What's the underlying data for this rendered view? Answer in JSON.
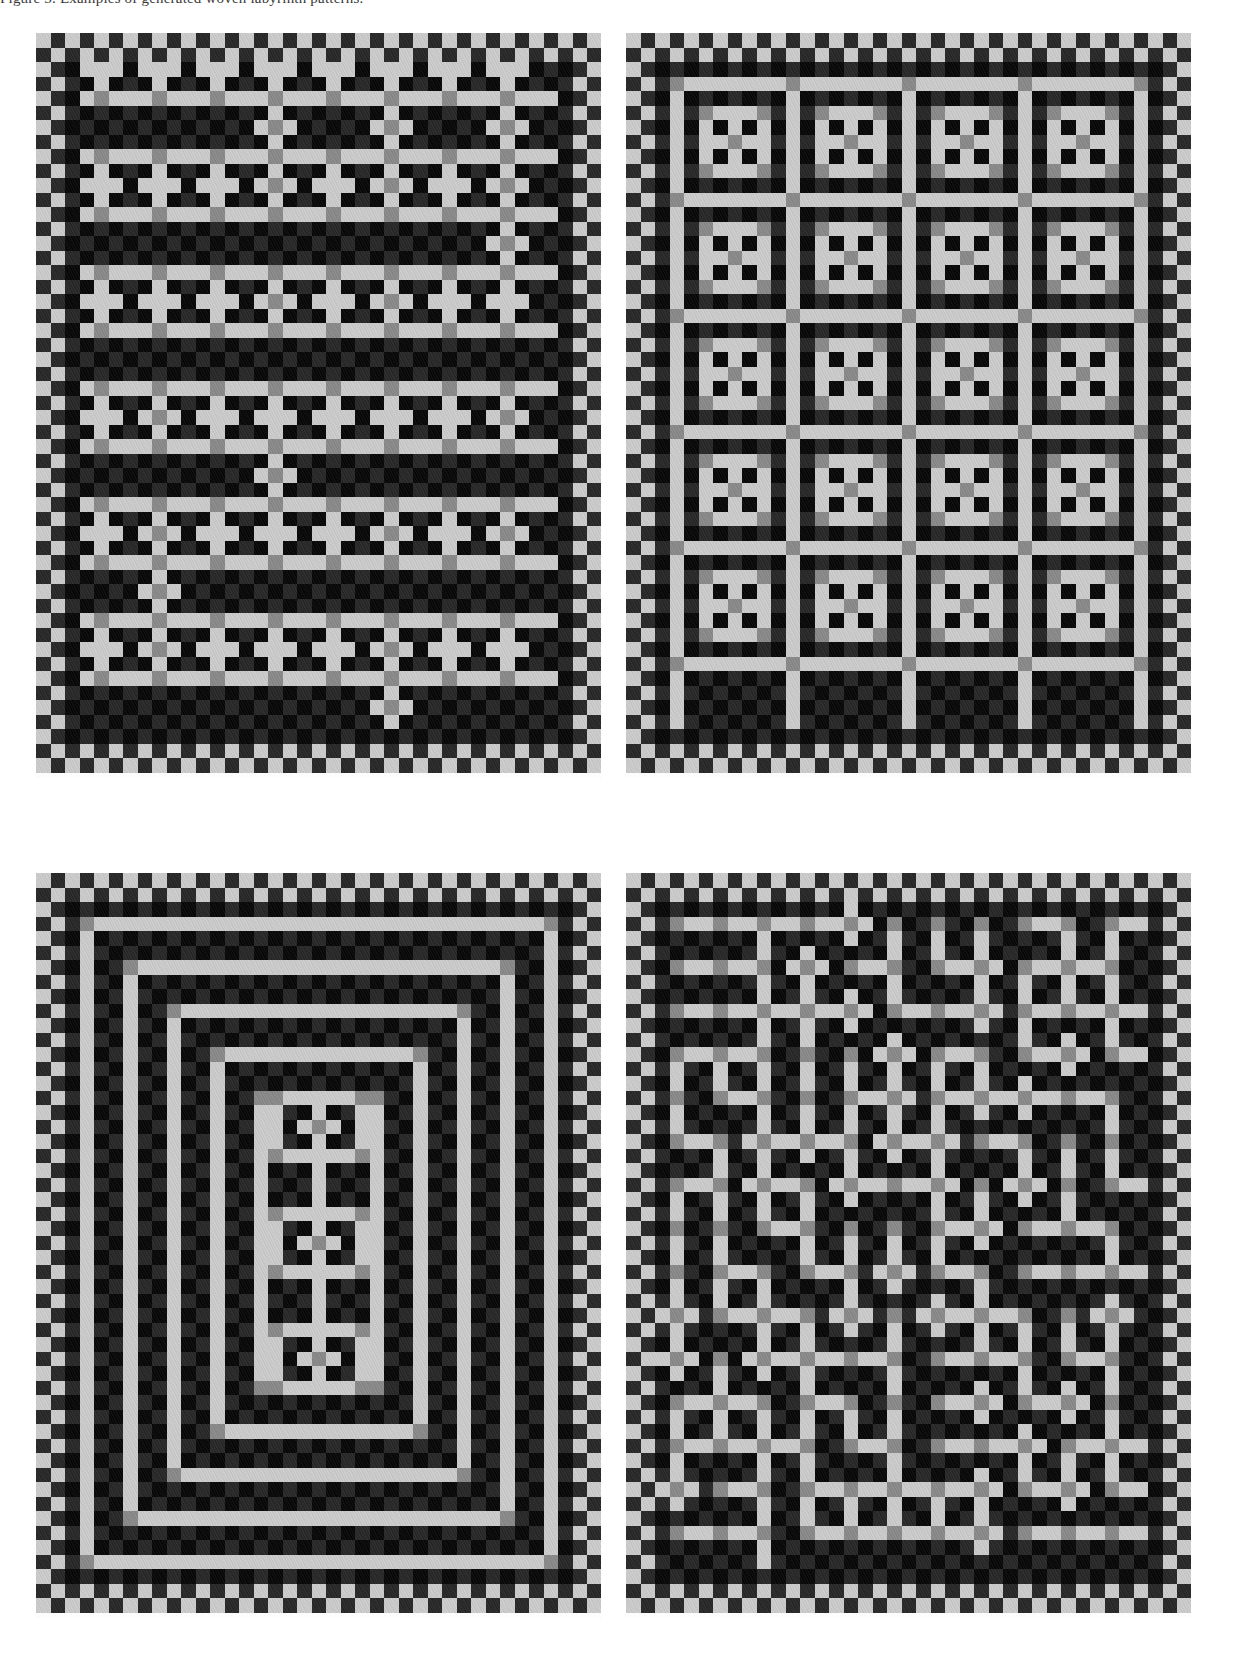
{
  "figure": {
    "caption_fragment": "Figure 5. Examples of generated woven labyrinth patterns.",
    "background_color": "#ffffff",
    "panel_count": 4
  },
  "palette": {
    "black": "#0c0c0c",
    "dark_grey": "#2b2b2b",
    "mid_grey": "#898989",
    "light_grey": "#c9c9c9",
    "paper": "#ffffff"
  },
  "grid": {
    "cell_px": 14.5,
    "cols": 39,
    "rows": 51,
    "panel_width_px": 565,
    "panel_height_px": 745
  },
  "panels": [
    {
      "id": "panel-1",
      "name": "meander-horizontal-rows",
      "label": "a",
      "motif": "horizontal meander rows",
      "seed": 101,
      "x": 36,
      "y": 33,
      "w": 565,
      "h": 745
    },
    {
      "id": "panel-2",
      "name": "boxed-cross-grid",
      "label": "b",
      "motif": "grid of boxed crosses",
      "seed": 202,
      "x": 626,
      "y": 33,
      "w": 565,
      "h": 745
    },
    {
      "id": "panel-3",
      "name": "concentric-rings",
      "label": "c",
      "motif": "concentric rectangular rings",
      "seed": 303,
      "x": 36,
      "y": 873,
      "w": 565,
      "h": 745
    },
    {
      "id": "panel-4",
      "name": "random-maze",
      "label": "d",
      "motif": "irregular maze / labyrinth",
      "seed": 404,
      "x": 626,
      "y": 873,
      "w": 565,
      "h": 745
    }
  ],
  "pattern_data": {
    "type": "binary-weave-grid",
    "description": "Each panel is a grid of cells. Background cells alternate between black and dark grey in a checkerboard. Thread paths are drawn in light grey with mid grey at crossing/turn cells.",
    "cell_states": [
      "background-black",
      "background-dark",
      "thread-light",
      "thread-cross-mid"
    ],
    "panel_1_paths": [
      {
        "type": "hline",
        "row": 3,
        "c0": 1,
        "c1": 37
      },
      {
        "type": "hline",
        "row": 7,
        "c0": 1,
        "c1": 37
      },
      {
        "type": "hline",
        "row": 11,
        "c0": 1,
        "c1": 37
      },
      {
        "type": "hline",
        "row": 15,
        "c0": 1,
        "c1": 37
      },
      {
        "type": "hline",
        "row": 19,
        "c0": 1,
        "c1": 37
      },
      {
        "type": "hline",
        "row": 23,
        "c0": 1,
        "c1": 37
      },
      {
        "type": "hline",
        "row": 27,
        "c0": 1,
        "c1": 37
      },
      {
        "type": "hline",
        "row": 31,
        "c0": 1,
        "c1": 37
      },
      {
        "type": "hline",
        "row": 35,
        "c0": 1,
        "c1": 37
      },
      {
        "type": "hline",
        "row": 39,
        "c0": 1,
        "c1": 37
      },
      {
        "type": "hline",
        "row": 43,
        "c0": 1,
        "c1": 37
      },
      {
        "type": "hline",
        "row": 47,
        "c0": 1,
        "c1": 37
      }
    ],
    "panel_2_cells": {
      "block_w": 8,
      "block_h": 8,
      "cols": 4,
      "rows": 6,
      "inner_cross": true
    },
    "panel_3_rings": [
      2,
      5,
      8,
      11,
      14,
      17
    ],
    "panel_4_random": {
      "density": 0.52,
      "branching": 0.34
    }
  }
}
